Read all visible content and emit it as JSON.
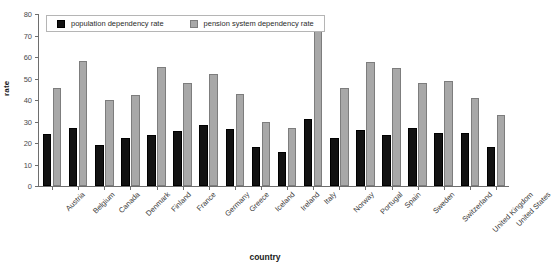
{
  "chart_data": {
    "type": "bar",
    "title": "",
    "xlabel": "country",
    "ylabel": "rate",
    "ylim": [
      0,
      80
    ],
    "yticks": [
      0,
      10,
      20,
      30,
      40,
      50,
      60,
      70,
      80
    ],
    "grid": false,
    "legend_position": "top-inside",
    "categories": [
      "Austria",
      "Belgium",
      "Canada",
      "Denmark",
      "Finland",
      "France",
      "Germany",
      "Greece",
      "Iceland",
      "Ireland",
      "Italy",
      "Norway",
      "Portugal",
      "Spain",
      "Sweden",
      "Switzerland",
      "United Kingdom",
      "United States"
    ],
    "series": [
      {
        "name": "population dependency rate",
        "color": "#121212",
        "values": [
          24,
          27,
          19,
          22.5,
          23.5,
          25.5,
          28.5,
          26.5,
          18,
          16,
          31,
          22.5,
          26,
          23.5,
          27,
          24.5,
          24.5,
          18
        ]
      },
      {
        "name": "pension system dependency rate",
        "color": "#a8a8a8",
        "values": [
          45.5,
          58,
          40,
          42.5,
          55.5,
          48,
          52,
          43,
          30,
          27,
          74,
          45.5,
          57.5,
          55,
          48,
          49,
          41,
          33
        ]
      }
    ]
  },
  "legend": {
    "items": [
      {
        "label": "population dependency rate",
        "swatch": "black-square-swatch"
      },
      {
        "label": "pension system dependency rate",
        "swatch": "gray-square-swatch"
      }
    ]
  },
  "axes": {
    "y_title": "rate",
    "x_title": "country",
    "y_tick_labels": [
      "0",
      "10",
      "20",
      "30",
      "40",
      "50",
      "60",
      "70",
      "80"
    ]
  }
}
